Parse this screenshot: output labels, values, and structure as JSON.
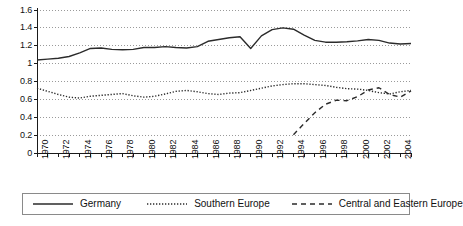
{
  "chart_data": {
    "type": "line",
    "title": "",
    "subtitle": "",
    "xlabel": "",
    "ylabel": "",
    "xlim": [
      1970,
      2005
    ],
    "ylim": [
      0,
      1.6
    ],
    "y_ticks": [
      0,
      0.2,
      0.4,
      0.6,
      0.8,
      1,
      1.2,
      1.4,
      1.6
    ],
    "y_tick_labels": [
      "0",
      "0.2",
      "0.4",
      "0.6",
      "0.8",
      "1",
      "1.2",
      "1.4",
      "1.6"
    ],
    "x_ticks": [
      1970,
      1971,
      1972,
      1973,
      1974,
      1975,
      1976,
      1977,
      1978,
      1979,
      1980,
      1981,
      1982,
      1983,
      1984,
      1985,
      1986,
      1987,
      1988,
      1989,
      1990,
      1991,
      1992,
      1993,
      1994,
      1995,
      1996,
      1997,
      1998,
      1999,
      2000,
      2001,
      2002,
      2003,
      2004,
      2005
    ],
    "x_tick_labels": [
      "1970",
      "1972",
      "1974",
      "1976",
      "1978",
      "1980",
      "1982",
      "1984",
      "1986",
      "1988",
      "1990",
      "1992",
      "1994",
      "1996",
      "1998",
      "2000",
      "2002",
      "2004"
    ],
    "x_tick_label_years": [
      1970,
      1972,
      1974,
      1976,
      1978,
      1980,
      1982,
      1984,
      1986,
      1988,
      1990,
      1992,
      1994,
      1996,
      1998,
      2000,
      2002,
      2004
    ],
    "grid": "horizontal-dotted",
    "legend_position": "bottom",
    "series": [
      {
        "name": "Germany",
        "style": "solid",
        "color": "#2b2b2b",
        "x": [
          1970,
          1971,
          1972,
          1973,
          1974,
          1975,
          1976,
          1977,
          1978,
          1979,
          1980,
          1981,
          1982,
          1983,
          1984,
          1985,
          1986,
          1987,
          1988,
          1989,
          1990,
          1991,
          1992,
          1993,
          1994,
          1995,
          1996,
          1997,
          1998,
          1999,
          2000,
          2001,
          2002,
          2003,
          2004,
          2005
        ],
        "values": [
          1.04,
          1.05,
          1.06,
          1.08,
          1.12,
          1.17,
          1.175,
          1.16,
          1.155,
          1.16,
          1.18,
          1.18,
          1.19,
          1.18,
          1.175,
          1.19,
          1.25,
          1.27,
          1.29,
          1.3,
          1.17,
          1.31,
          1.38,
          1.4,
          1.385,
          1.32,
          1.26,
          1.24,
          1.24,
          1.245,
          1.255,
          1.27,
          1.26,
          1.23,
          1.22,
          1.225
        ]
      },
      {
        "name": "Southern Europe",
        "style": "dotted",
        "color": "#2b2b2b",
        "x": [
          1970,
          1971,
          1972,
          1973,
          1974,
          1975,
          1976,
          1977,
          1978,
          1979,
          1980,
          1981,
          1982,
          1983,
          1984,
          1985,
          1986,
          1987,
          1988,
          1989,
          1990,
          1991,
          1992,
          1993,
          1994,
          1995,
          1996,
          1997,
          1998,
          1999,
          2000,
          2001,
          2002,
          2003,
          2004,
          2005
        ],
        "values": [
          0.725,
          0.69,
          0.655,
          0.625,
          0.615,
          0.635,
          0.645,
          0.655,
          0.665,
          0.64,
          0.625,
          0.635,
          0.66,
          0.69,
          0.7,
          0.685,
          0.665,
          0.655,
          0.67,
          0.675,
          0.7,
          0.725,
          0.75,
          0.765,
          0.775,
          0.775,
          0.765,
          0.755,
          0.735,
          0.72,
          0.715,
          0.7,
          0.675,
          0.66,
          0.685,
          0.7
        ]
      },
      {
        "name": "Central and Eastern Europe",
        "style": "dashed",
        "color": "#2b2b2b",
        "x": [
          1994,
          1995,
          1996,
          1997,
          1998,
          1999,
          2000,
          2001,
          2002,
          2003,
          2004,
          2005
        ],
        "values": [
          0.205,
          0.33,
          0.45,
          0.545,
          0.59,
          0.585,
          0.63,
          0.705,
          0.73,
          0.655,
          0.625,
          0.695
        ]
      }
    ]
  },
  "legend": {
    "items": [
      {
        "label": "Germany",
        "style": "solid"
      },
      {
        "label": "Southern Europe",
        "style": "dotted"
      },
      {
        "label": "Central and Eastern Europe",
        "style": "dashed"
      }
    ]
  }
}
